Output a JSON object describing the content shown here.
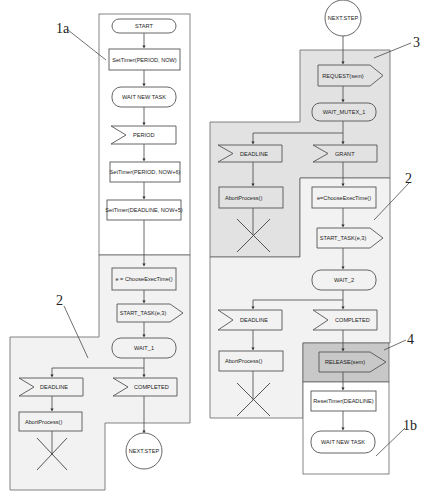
{
  "diagram": {
    "type": "SDL flowchart (real-time task scheduling)",
    "colors": {
      "background": "#ffffff",
      "region_1_white": "#ffffff",
      "region_2_light": "#f2f2f2",
      "region_3_gray": "#e2e2e2",
      "region_4_dark": "#c8c8c8",
      "shape_stroke": "#555555",
      "shape_fill": "#f7f7f7"
    },
    "reference_labels": {
      "ref_1a": "1a",
      "ref_2_left": "2",
      "ref_3": "3",
      "ref_2_right": "2",
      "ref_4": "4",
      "ref_1b": "1b"
    },
    "left_flow": {
      "start": "START",
      "set_timer_1": "SetTimer(PERIOD, NOW)",
      "wait_new_task": "WAIT NEW TASK",
      "period_signal": "PERIOD",
      "set_timer_2": "SetTimer(PERIOD, NOW+6)",
      "set_timer_3": "SetTimer(DEADLINE, NOW+5)",
      "choose_exec": "e = ChooseExecTime()",
      "start_task": "START_TASK(e,3)",
      "wait_1": "WAIT_1",
      "deadline": "DEADLINE",
      "completed": "COMPLETED",
      "abort": "AbortProcess()",
      "next_step": "NEXT.STEP"
    },
    "right_flow": {
      "next_step": "NEXT.STEP",
      "request": "REQUEST(sem)",
      "wait_mutex": "WAIT_MUTEX_1",
      "deadline_1": "DEADLINE",
      "grant": "GRANT",
      "abort_1": "AbortProcess()",
      "choose_exec": "e=ChooseExecTime()",
      "start_task": "START_TASK(e,3)",
      "wait_2": "WAIT_2",
      "deadline_2": "DEADLINE",
      "completed": "COMPLETED",
      "abort_2": "AbortProcess()",
      "release": "RELEASE(sem)",
      "reset_timer": "ResetTimer(DEADLINE)",
      "wait_new_task": "WAIT NEW TASK"
    }
  }
}
